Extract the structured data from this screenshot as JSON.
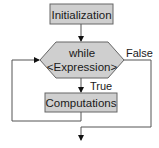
{
  "diagram": {
    "type": "flowchart",
    "colors": {
      "node_fill": "#cfcfcf",
      "node_stroke": "#666666",
      "line": "#555555",
      "arrow": "#111111",
      "text": "#1a1a1a"
    },
    "nodes": {
      "init": {
        "label": "Initialization",
        "shape": "rectangle"
      },
      "condition": {
        "line1": "while",
        "line2": "<Expression>",
        "shape": "hexagon"
      },
      "body": {
        "label": "Computations",
        "shape": "rectangle"
      }
    },
    "edges": {
      "true_label": "True",
      "false_label": "False"
    }
  }
}
